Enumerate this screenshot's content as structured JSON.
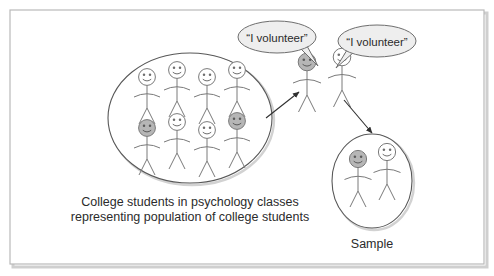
{
  "frame": {
    "border_color": "#b9b9b9",
    "shadow_color": "#c9c9c9",
    "background": "#ffffff"
  },
  "palette": {
    "outline": "#6e6e6e",
    "ellipse_stroke": "#585858",
    "head_fill_light": "#ffffff",
    "head_fill_shaded": "#b6b6b6",
    "bubble_fill": "#eeeeee",
    "bubble_stroke": "#6e6e6e",
    "arrow_color": "#2f2f2f",
    "text_color": "#2b2b2b"
  },
  "population": {
    "label_line_1": "College students in psychology classes",
    "label_line_2": "representing population of college students",
    "ellipse": {
      "cx": 190,
      "cy": 118,
      "rx": 82,
      "ry": 65
    },
    "figures": [
      {
        "id": "pop-1",
        "x": 147,
        "y": 77,
        "shaded": false
      },
      {
        "id": "pop-2",
        "x": 177,
        "y": 70,
        "shaded": false
      },
      {
        "id": "pop-3",
        "x": 207,
        "y": 77,
        "shaded": false
      },
      {
        "id": "pop-4",
        "x": 237,
        "y": 70,
        "shaded": false
      },
      {
        "id": "pop-5",
        "x": 147,
        "y": 128,
        "shaded": true
      },
      {
        "id": "pop-6",
        "x": 177,
        "y": 122,
        "shaded": false
      },
      {
        "id": "pop-7",
        "x": 207,
        "y": 130,
        "shaded": false
      },
      {
        "id": "pop-8",
        "x": 237,
        "y": 121,
        "shaded": true
      }
    ]
  },
  "volunteers": {
    "figures": [
      {
        "id": "vol-1",
        "x": 307,
        "y": 62,
        "shaded": true
      },
      {
        "id": "vol-2",
        "x": 342,
        "y": 57,
        "shaded": false
      }
    ],
    "bubbles": [
      {
        "id": "bubble-left",
        "text": "“I volunteer”",
        "cx": 277,
        "cy": 37,
        "rx": 39,
        "ry": 16,
        "tail": "302,50 316,64 306,48"
      },
      {
        "id": "bubble-right",
        "text": "“I volunteer”",
        "cx": 377,
        "cy": 41,
        "rx": 39,
        "ry": 16,
        "tail": "352,52 336,64 348,50"
      }
    ]
  },
  "sample": {
    "label": "Sample",
    "ellipse": {
      "cx": 372,
      "cy": 181,
      "rx": 40,
      "ry": 47
    },
    "figures": [
      {
        "id": "smp-1",
        "x": 358,
        "y": 157,
        "shaded": true
      },
      {
        "id": "smp-2",
        "x": 385,
        "y": 150,
        "shaded": false
      }
    ]
  },
  "arrows": [
    {
      "id": "arrow-population-to-volunteers",
      "x1": 266,
      "y1": 118,
      "x2": 299,
      "y2": 92
    },
    {
      "id": "arrow-volunteers-to-sample",
      "x1": 344,
      "y1": 100,
      "x2": 372,
      "y2": 134
    }
  ]
}
